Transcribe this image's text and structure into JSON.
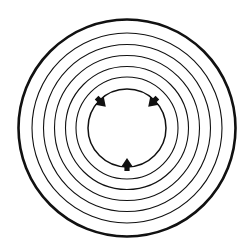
{
  "diagram": {
    "background": "#ffffff",
    "stroke_color": "#111111",
    "center": {
      "x": 127,
      "y": 128
    },
    "outer_circle": {
      "r": 108.5,
      "stroke_width": 2.6
    },
    "rings": [
      {
        "r": 95,
        "stroke_width": 1.1
      },
      {
        "r": 83.5,
        "stroke_width": 1.1
      },
      {
        "r": 72.5,
        "stroke_width": 1.1
      },
      {
        "r": 61.5,
        "stroke_width": 1.1
      },
      {
        "r": 51,
        "stroke_width": 1.1
      }
    ],
    "inner_circle": {
      "r": 39,
      "stroke_width": 1.5
    },
    "arrows": [
      {
        "name": "arrow-upper-left",
        "angle_deg": 225,
        "direction": "inward"
      },
      {
        "name": "arrow-upper-right",
        "angle_deg": 315,
        "direction": "inward"
      },
      {
        "name": "arrow-bottom",
        "angle_deg": 90,
        "direction": "inward"
      }
    ]
  }
}
